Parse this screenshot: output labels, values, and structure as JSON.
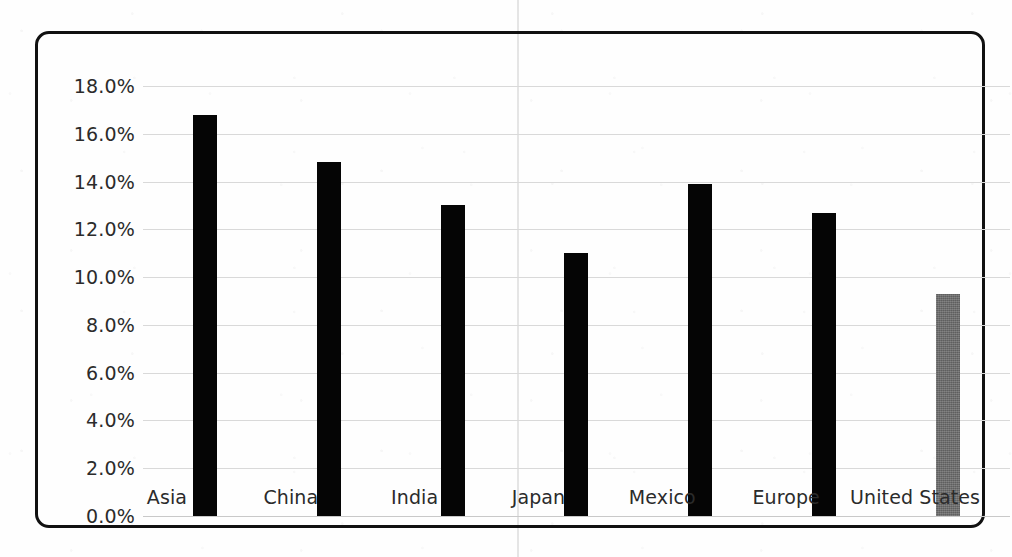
{
  "chart_data": {
    "type": "bar",
    "title": "",
    "subtitle": "",
    "xlabel": "",
    "ylabel": "",
    "categories": [
      "Asia",
      "China",
      "India",
      "Japan",
      "Mexico",
      "Europe",
      "United States"
    ],
    "values": [
      16.8,
      14.8,
      13.0,
      11.0,
      13.9,
      12.7,
      9.3
    ],
    "value_labels": [
      "16.8%",
      "14.8%",
      "13.0%",
      "11.0%",
      "13.9%",
      "12.7%",
      "9.3%"
    ],
    "series": [
      {
        "name": "",
        "values": [
          16.8,
          14.8,
          13.0,
          11.0,
          13.9,
          12.7,
          9.3
        ]
      }
    ],
    "ylim": [
      0.0,
      18.0
    ],
    "ytick_values": [
      18.0,
      16.0,
      14.0,
      12.0,
      10.0,
      8.0,
      6.0,
      4.0,
      2.0,
      0.0
    ],
    "ytick_labels": [
      "18.0%",
      "16.0%",
      "14.0%",
      "12.0%",
      "10.0%",
      "8.0%",
      "6.0%",
      "4.0%",
      "2.0%",
      "0.0%"
    ],
    "grid": true,
    "grid_axis": "y",
    "legend": false,
    "legend_position": "none",
    "bar_colors": [
      "#050505",
      "#050505",
      "#050505",
      "#050505",
      "#050505",
      "#050505",
      "#6a6a6a"
    ],
    "highlight_category": "United States",
    "highlight_color": "#6a6a6a",
    "default_bar_color": "#050505"
  },
  "frame": {
    "border_color": "#111111",
    "background_color": "#fefefe",
    "gridline_color": "#d9d9d9"
  },
  "ticks": {
    "y": [
      {
        "label": "18.0%",
        "value": 18.0
      },
      {
        "label": "16.0%",
        "value": 16.0
      },
      {
        "label": "14.0%",
        "value": 14.0
      },
      {
        "label": "12.0%",
        "value": 12.0
      },
      {
        "label": "10.0%",
        "value": 10.0
      },
      {
        "label": "8.0%",
        "value": 8.0
      },
      {
        "label": "6.0%",
        "value": 6.0
      },
      {
        "label": "4.0%",
        "value": 4.0
      },
      {
        "label": "2.0%",
        "value": 2.0
      },
      {
        "label": "0.0%",
        "value": 0.0
      }
    ]
  }
}
